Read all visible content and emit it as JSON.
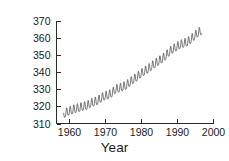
{
  "chart_data": {
    "type": "line",
    "title": "",
    "xlabel": "Year",
    "ylabel": "CO2 concentration (ppm)",
    "ylabel_parts": {
      "pre": "CO",
      "sub": "2",
      "post": " concentration (ppm)"
    },
    "xlim": [
      1956.5,
      2000
    ],
    "ylim": [
      310,
      370
    ],
    "xticks": [
      1960,
      1970,
      1980,
      1990,
      2000
    ],
    "yticks": [
      310,
      320,
      330,
      340,
      350,
      360,
      370
    ],
    "xtick_labels": [
      "1960",
      "1970",
      "1980",
      "1990",
      "2000"
    ],
    "ytick_labels": [
      "310",
      "320",
      "330",
      "340",
      "350",
      "360",
      "370"
    ],
    "grid": false,
    "legend": "none",
    "series_name": "Mauna Loa atmospheric CO2 (Keeling Curve)",
    "line_color": "#4a4a4a",
    "axis_color": "#2b2b2b",
    "background_color": "#ffffff",
    "seasonal_amplitude_ppm": 3.0,
    "seasonal_peak_month": 5,
    "seasonal_trough_month": 10,
    "x": [
      1958.5,
      1959,
      1960,
      1961,
      1962,
      1963,
      1964,
      1965,
      1966,
      1967,
      1968,
      1969,
      1970,
      1971,
      1972,
      1973,
      1974,
      1975,
      1976,
      1977,
      1978,
      1979,
      1980,
      1981,
      1982,
      1983,
      1984,
      1985,
      1986,
      1987,
      1988,
      1989,
      1990,
      1991,
      1992,
      1993,
      1994,
      1995,
      1996,
      1997
    ],
    "values": [
      315.0,
      315.8,
      316.9,
      317.6,
      318.4,
      319.0,
      319.6,
      320.0,
      321.4,
      322.2,
      323.0,
      324.6,
      325.7,
      326.3,
      327.5,
      329.7,
      330.2,
      331.1,
      332.0,
      333.8,
      335.4,
      336.8,
      338.7,
      340.1,
      341.4,
      343.0,
      344.6,
      346.0,
      347.4,
      349.2,
      351.6,
      353.1,
      354.4,
      355.6,
      356.4,
      357.1,
      358.8,
      360.8,
      362.6,
      363.8
    ],
    "annual_means_note": "Annual mean trend values in ppm; rendered line adds a seasonal sawtooth of roughly +/- 3 ppm each year."
  },
  "chart": {
    "y_axis_title": "CO2 concentration (ppm)",
    "x_axis_title": "Year"
  }
}
